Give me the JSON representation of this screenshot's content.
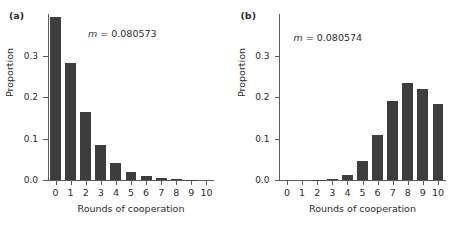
{
  "figure": {
    "panels": [
      {
        "label": "(a)",
        "annotation_prefix": "m",
        "annotation_value": " = 0.080573",
        "xlabel": "Rounds of cooperation",
        "ylabel": "Proportion"
      },
      {
        "label": "(b)",
        "annotation_prefix": "m",
        "annotation_value": " = 0.080574",
        "xlabel": "Rounds of cooperation",
        "ylabel": "Proportion"
      }
    ]
  },
  "chart_data": [
    {
      "type": "bar",
      "title": "(a)",
      "categories": [
        "0",
        "1",
        "2",
        "3",
        "4",
        "5",
        "6",
        "7",
        "8",
        "9",
        "10"
      ],
      "values": [
        0.393,
        0.283,
        0.163,
        0.085,
        0.042,
        0.019,
        0.009,
        0.004,
        0.002,
        0.001,
        0.0
      ],
      "xlabel": "Rounds of cooperation",
      "ylabel": "Proportion",
      "ylim": [
        0.0,
        0.4
      ],
      "yticks": [
        0.0,
        0.1,
        0.2,
        0.3
      ],
      "ytick_labels": [
        "0.0",
        "0.1",
        "0.2",
        "0.3"
      ],
      "grid": false,
      "legend": "none",
      "annotation": "m = 0.080573",
      "bar_color": "#3d3d3d"
    },
    {
      "type": "bar",
      "title": "(b)",
      "categories": [
        "0",
        "1",
        "2",
        "3",
        "4",
        "5",
        "6",
        "7",
        "8",
        "9",
        "10"
      ],
      "values": [
        0.0,
        0.0,
        0.001,
        0.003,
        0.013,
        0.045,
        0.109,
        0.19,
        0.234,
        0.22,
        0.184
      ],
      "xlabel": "Rounds of cooperation",
      "ylabel": "Proportion",
      "ylim": [
        0.0,
        0.4
      ],
      "yticks": [
        0.0,
        0.1,
        0.2,
        0.3
      ],
      "ytick_labels": [
        "0.0",
        "0.1",
        "0.2",
        "0.3"
      ],
      "grid": false,
      "legend": "none",
      "annotation": "m = 0.080574",
      "bar_color": "#3d3d3d"
    }
  ],
  "axis": {
    "color": "#5a5a5a",
    "tick_color": "#5a5a5a",
    "text_color": "#2b2b2b"
  }
}
